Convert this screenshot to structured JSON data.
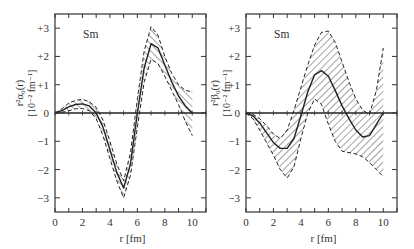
{
  "chart_data": [
    {
      "type": "line",
      "panel": "left",
      "annotation": "Sm",
      "xlabel": "r [fm]",
      "ylabel": "r²α₀(r)",
      "ylabel_units": "[10⁻² fm⁻¹]",
      "xlim": [
        0,
        11
      ],
      "ylim": [
        -3.5,
        3.5
      ],
      "xticks": [
        0,
        2,
        4,
        6,
        8,
        10
      ],
      "xtick_labels": [
        "0",
        "2",
        "4",
        "6",
        "8",
        "10"
      ],
      "yticks": [
        3,
        2,
        1,
        0,
        -1,
        -2,
        -3
      ],
      "ytick_labels": [
        "+3",
        "+2",
        "+1",
        "0",
        "−1",
        "−2",
        "−3"
      ],
      "grid": false,
      "series": [
        {
          "name": "central",
          "style": "solid",
          "x": [
            0,
            0.5,
            1,
            1.5,
            2,
            2.5,
            3,
            3.5,
            4,
            4.5,
            5,
            5.5,
            6,
            6.5,
            7,
            7.5,
            8,
            8.5,
            9,
            9.5,
            10
          ],
          "values": [
            0,
            0.08,
            0.22,
            0.3,
            0.32,
            0.25,
            0.0,
            -0.5,
            -1.3,
            -2.1,
            -2.65,
            -1.8,
            0.0,
            1.6,
            2.45,
            2.3,
            1.7,
            1.1,
            0.6,
            0.25,
            0.0
          ]
        },
        {
          "name": "upper bound",
          "style": "dashed",
          "x": [
            0,
            0.5,
            1,
            1.5,
            2,
            2.5,
            3,
            3.5,
            4,
            4.5,
            5,
            5.5,
            6,
            6.5,
            7,
            7.5,
            8,
            8.5,
            9,
            9.5,
            10
          ],
          "values": [
            0,
            0.15,
            0.35,
            0.45,
            0.48,
            0.4,
            0.2,
            -0.25,
            -1.0,
            -1.8,
            -2.4,
            -1.4,
            0.5,
            2.2,
            3.05,
            2.75,
            2.0,
            1.4,
            1.0,
            0.8,
            0.75
          ]
        },
        {
          "name": "lower bound",
          "style": "dashed",
          "x": [
            0,
            0.5,
            1,
            1.5,
            2,
            2.5,
            3,
            3.5,
            4,
            4.5,
            5,
            5.5,
            6,
            6.5,
            7,
            7.5,
            8,
            8.5,
            9,
            9.5,
            10
          ],
          "values": [
            0,
            0.02,
            0.08,
            0.15,
            0.16,
            0.08,
            -0.2,
            -0.8,
            -1.6,
            -2.4,
            -3.0,
            -2.2,
            -0.5,
            1.1,
            1.9,
            1.75,
            1.3,
            0.8,
            0.3,
            -0.3,
            -0.8
          ]
        }
      ]
    },
    {
      "type": "line",
      "panel": "right",
      "annotation": "Sm",
      "xlabel": "r [fm]",
      "ylabel": "r²β₀(r)",
      "ylabel_units": "[10⁻² fm⁻¹]",
      "xlim": [
        0,
        11
      ],
      "ylim": [
        -3.5,
        3.5
      ],
      "xticks": [
        0,
        2,
        4,
        6,
        8,
        10
      ],
      "xtick_labels": [
        "0",
        "2",
        "4",
        "6",
        "8",
        "10"
      ],
      "yticks": [
        3,
        2,
        1,
        0,
        -1,
        -2,
        -3
      ],
      "ytick_labels": [
        "+3",
        "+2",
        "+1",
        "0",
        "−1",
        "−2",
        "−3"
      ],
      "grid": false,
      "series": [
        {
          "name": "central",
          "style": "solid",
          "x": [
            0,
            0.5,
            1,
            1.5,
            2,
            2.5,
            3,
            3.5,
            4,
            4.5,
            5,
            5.5,
            6,
            6.5,
            7,
            7.5,
            8,
            8.5,
            9,
            9.5,
            10
          ],
          "values": [
            0,
            -0.1,
            -0.35,
            -0.7,
            -1.05,
            -1.25,
            -1.25,
            -0.9,
            -0.1,
            0.75,
            1.35,
            1.5,
            1.3,
            0.8,
            0.25,
            -0.2,
            -0.6,
            -0.85,
            -0.8,
            -0.4,
            0.0
          ]
        },
        {
          "name": "upper bound",
          "style": "dashed",
          "x": [
            0,
            0.5,
            1,
            1.5,
            2,
            2.5,
            3,
            3.5,
            4,
            4.5,
            5,
            5.5,
            6,
            6.5,
            7,
            7.5,
            8,
            8.5,
            9,
            9.5,
            10
          ],
          "values": [
            0,
            -0.05,
            -0.2,
            -0.45,
            -0.75,
            -0.9,
            -0.6,
            0.1,
            0.9,
            1.7,
            2.4,
            2.85,
            2.9,
            2.5,
            1.8,
            1.1,
            0.5,
            0.1,
            -0.05,
            0.8,
            2.3
          ]
        },
        {
          "name": "lower bound",
          "style": "dashed",
          "x": [
            0,
            0.5,
            1,
            1.5,
            2,
            2.5,
            3,
            3.5,
            4,
            4.5,
            5,
            5.5,
            6,
            6.5,
            7,
            7.5,
            8,
            8.5,
            9,
            9.5,
            10
          ],
          "values": [
            0,
            -0.2,
            -0.6,
            -1.05,
            -1.5,
            -2.0,
            -2.3,
            -1.9,
            -0.9,
            0.0,
            0.5,
            0.3,
            -0.4,
            -1.0,
            -1.35,
            -1.4,
            -1.45,
            -1.55,
            -1.75,
            -2.0,
            -2.25
          ]
        }
      ]
    }
  ]
}
